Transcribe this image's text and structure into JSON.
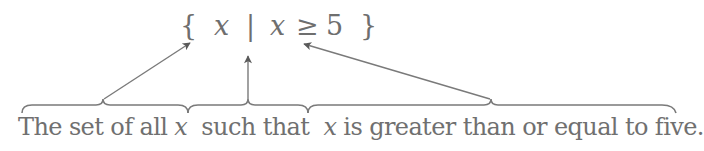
{
  "diagram": {
    "type": "annotated-set-builder-notation",
    "notation": {
      "open_brace": "{",
      "variable": "x",
      "separator": "|",
      "condition_var": "x",
      "relation": "≥",
      "value": "5",
      "close_brace": "}"
    },
    "caption": {
      "part1": "The set of all ",
      "part1_var": "x",
      "part2": "such that",
      "part3_var": "x",
      "part3": " is greater than or equal to five."
    },
    "annotations": [
      {
        "brace_label": "The set of all x",
        "points_to": "{ x"
      },
      {
        "brace_label": "such that",
        "points_to": "|"
      },
      {
        "brace_label": "x is greater than or equal to five.",
        "points_to": "x ≥ 5 }"
      }
    ],
    "colors": {
      "text": "#6e6e6e",
      "lines": "#7a7a7a",
      "arrowheads": "#5a5a5a"
    }
  }
}
